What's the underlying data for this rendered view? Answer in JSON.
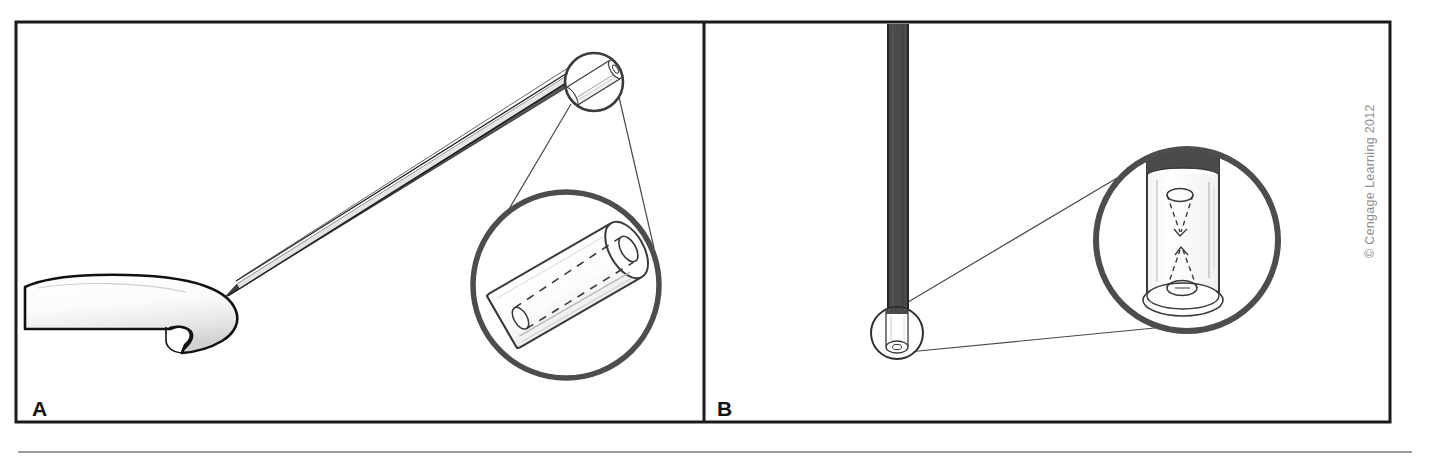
{
  "figure": {
    "background_color": "#ffffff",
    "width": 1454,
    "height": 467,
    "frame": {
      "stroke_color": "#1a1a1a",
      "stroke_width": 3,
      "x": 16,
      "y": 22,
      "width": 1374,
      "height": 400,
      "divider_x": 704
    },
    "footer_rule": {
      "color": "#9a9a9a",
      "x1": 18,
      "x2": 1412,
      "y": 452,
      "thickness": 2
    }
  },
  "credit": {
    "text": "© Cengage Learning 2012",
    "color": "#8e8e8e",
    "rotation_degrees": -90
  },
  "panels": [
    {
      "id": "A",
      "label": "A",
      "caption_position": "bottom-left",
      "description": "Fingertip holding a tapered probe/needle; small circular inset at the probe tip leads to a large magnified circle showing the hollow lumen of the cannula.",
      "elements": {
        "fingertip": {
          "name": "fingertip",
          "fill_start": "#ffffff",
          "fill_end": "#d8d8d8",
          "outline": "#111111"
        },
        "probe": {
          "name": "tapered-probe",
          "body_fill": "#4a4a4a",
          "highlight_fill": "#ffffff",
          "outline": "#111111"
        },
        "small_callout_circle": {
          "name": "small-callout-circle",
          "cx": 594,
          "cy": 82,
          "r": 30,
          "stroke": "#3c3c3c",
          "stroke_width": 2.5
        },
        "magnified_circle": {
          "name": "magnified-callout-circle",
          "cx": 566,
          "cy": 285,
          "r": 94,
          "stroke": "#4d4d4d",
          "stroke_width": 5
        },
        "leader_lines": {
          "name": "callout-leader-lines",
          "stroke": "#4a4a4a",
          "stroke_width": 1.2
        },
        "magnified_content": {
          "name": "cannula-lumen-detail",
          "tube_fill": "#ffffff",
          "tube_outline": "#3a3a3a",
          "lumen_dashed_stroke": "#3a3a3a",
          "dash_pattern": "7 6"
        }
      }
    },
    {
      "id": "B",
      "label": "B",
      "caption_position": "bottom-left",
      "description": "Vertical dark rod running from the top frame edge down to a small circular inset near its lower end; leader lines open into a large magnified circle showing two opposing conical (funnel) structures inside the tube lumen.",
      "elements": {
        "vertical_rod": {
          "name": "vertical-rod",
          "fill": "#4a4a4a",
          "outline": "#1a1a1a",
          "x": 888,
          "y_top": 24,
          "width": 20,
          "y_bottom": 318
        },
        "small_callout_circle": {
          "name": "small-callout-circle",
          "cx": 897,
          "cy": 333,
          "r": 27,
          "stroke": "#2f2f2f",
          "stroke_width": 2
        },
        "magnified_circle": {
          "name": "magnified-callout-circle",
          "cx": 1187,
          "cy": 240,
          "r": 93,
          "stroke": "#4d4d4d",
          "stroke_width": 6
        },
        "leader_lines": {
          "name": "callout-leader-lines",
          "stroke": "#4a4a4a",
          "stroke_width": 1.2
        },
        "magnified_content": {
          "name": "tube-cone-detail",
          "tube_fill": "#ffffff",
          "tube_outline": "#3a3a3a",
          "cap_fill": "#4a4a4a",
          "cone_dashed_stroke": "#3a3a3a",
          "dash_pattern": "5 4"
        }
      }
    }
  ],
  "colors": {
    "ink": "#1a1a1a",
    "dark_gray": "#4a4a4a",
    "mid_gray": "#8e8e8e",
    "rule_gray": "#9a9a9a",
    "paper": "#ffffff"
  }
}
